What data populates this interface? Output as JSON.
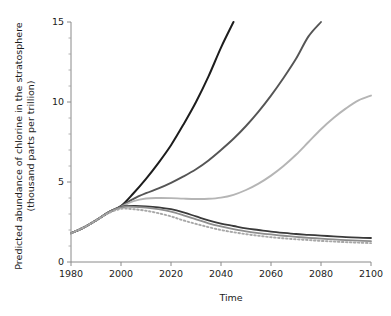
{
  "chart_data": {
    "type": "line",
    "title": "",
    "xlabel": "Time",
    "ylabel": "Predicted abundance of chlorine in the stratosphere (thousand parts per trillion)",
    "ylabel_line1": "Predicted abundance of chlorine in the stratosphere",
    "ylabel_line2": "(thousand parts per trillion)",
    "xlim": [
      1980,
      2100
    ],
    "ylim": [
      0,
      15
    ],
    "xticks": [
      1980,
      2000,
      2020,
      2040,
      2060,
      2080,
      2100
    ],
    "xticklabels": [
      "1980",
      "2000",
      "2020",
      "2040",
      "2060",
      "2080",
      "2100"
    ],
    "yticks": [
      0,
      5,
      10,
      15
    ],
    "yticklabels": [
      "0",
      "5",
      "10",
      "15"
    ],
    "yminorticks": [
      1,
      2,
      3,
      4,
      6,
      7,
      8,
      9,
      11,
      12,
      13,
      14
    ],
    "grid": false,
    "legend": "none",
    "x": [
      1980,
      1985,
      1990,
      1995,
      2000,
      2005,
      2010,
      2015,
      2020,
      2025,
      2030,
      2035,
      2040,
      2045,
      2050,
      2055,
      2060,
      2065,
      2070,
      2075,
      2080,
      2085,
      2090,
      2095,
      2100
    ],
    "series": [
      {
        "name": "no-protocol",
        "color": "#1d1d1d",
        "width": 2.0,
        "dash": "none",
        "values": [
          1.8,
          2.15,
          2.6,
          3.1,
          3.5,
          4.3,
          5.2,
          6.2,
          7.3,
          8.6,
          10.0,
          11.6,
          13.4,
          15.0,
          null,
          null,
          null,
          null,
          null,
          null,
          null,
          null,
          null,
          null,
          null
        ]
      },
      {
        "name": "montreal-1987",
        "color": "#555555",
        "width": 1.9,
        "dash": "none",
        "values": [
          1.8,
          2.15,
          2.6,
          3.1,
          3.5,
          3.95,
          4.3,
          4.6,
          4.95,
          5.35,
          5.8,
          6.35,
          7.0,
          7.7,
          8.5,
          9.4,
          10.4,
          11.5,
          12.7,
          14.1,
          15.0,
          null,
          null,
          null,
          null
        ]
      },
      {
        "name": "london-1990",
        "color": "#b5b5b5",
        "width": 1.9,
        "dash": "none",
        "values": [
          1.8,
          2.15,
          2.6,
          3.1,
          3.45,
          3.8,
          3.97,
          4.0,
          3.99,
          3.96,
          3.94,
          3.95,
          4.02,
          4.2,
          4.5,
          4.9,
          5.4,
          6.0,
          6.7,
          7.5,
          8.3,
          9.0,
          9.6,
          10.1,
          10.4
        ]
      },
      {
        "name": "copenhagen-1992",
        "color": "#3a3a3a",
        "width": 1.8,
        "dash": "none",
        "values": [
          1.8,
          2.15,
          2.6,
          3.1,
          3.45,
          3.5,
          3.48,
          3.42,
          3.3,
          3.1,
          2.85,
          2.6,
          2.4,
          2.25,
          2.1,
          2.0,
          1.9,
          1.82,
          1.75,
          1.7,
          1.65,
          1.6,
          1.55,
          1.52,
          1.5
        ]
      },
      {
        "name": "zero-emissions",
        "color": "#8e8e8e",
        "width": 1.8,
        "dash": "none",
        "values": [
          1.8,
          2.15,
          2.6,
          3.1,
          3.42,
          3.45,
          3.4,
          3.3,
          3.15,
          2.92,
          2.67,
          2.42,
          2.22,
          2.05,
          1.92,
          1.81,
          1.72,
          1.64,
          1.57,
          1.51,
          1.46,
          1.41,
          1.37,
          1.34,
          1.3
        ]
      },
      {
        "name": "natural-background",
        "color": "#a8a8a8",
        "width": 1.9,
        "dash": "dotted",
        "values": [
          1.8,
          2.15,
          2.6,
          3.05,
          3.32,
          3.3,
          3.2,
          3.05,
          2.85,
          2.6,
          2.38,
          2.18,
          2.0,
          1.86,
          1.74,
          1.64,
          1.55,
          1.48,
          1.42,
          1.37,
          1.32,
          1.28,
          1.24,
          1.21,
          1.18
        ]
      }
    ]
  },
  "colors": {
    "axis": "#8a8a8a",
    "text": "#1c1c1c",
    "background": "#ffffff"
  }
}
